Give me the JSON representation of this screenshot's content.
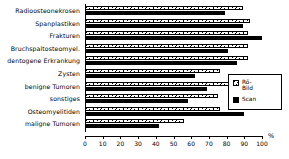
{
  "chart_data": {
    "type": "bar",
    "orientation": "horizontal",
    "title": "",
    "xlabel": "%",
    "ylabel": "",
    "xlim": [
      0,
      100
    ],
    "xticks": [
      0,
      10,
      20,
      30,
      40,
      50,
      60,
      70,
      80,
      90,
      100
    ],
    "grid": false,
    "legend_position": "right",
    "categories": [
      "Radioosteonekrosen",
      "Spanplastiken",
      "Frakturen",
      "Bruchspaltosteomyel.",
      "dentogene Erkrankung",
      "Zysten",
      "benigne Tumoren",
      "sonstiges",
      "Osteomyelitiden",
      "maligne Tumoren"
    ],
    "series": [
      {
        "name": "Rö-Bild",
        "pattern": "hatched",
        "color": "#ffffff",
        "values": [
          89,
          93,
          92,
          92,
          92,
          76,
          83,
          75,
          76,
          56
        ]
      },
      {
        "name": "Scan",
        "pattern": "solid",
        "color": "#000000",
        "values": [
          79,
          89,
          100,
          81,
          86,
          62,
          69,
          58,
          90,
          42
        ]
      }
    ]
  },
  "legend": {
    "items": [
      {
        "label": "Rö-\nBild",
        "swatch": "hatched-swatch"
      },
      {
        "label": "Scan",
        "swatch": "solid-black-swatch"
      }
    ]
  },
  "axis": {
    "unit_label": "%",
    "tick_labels": [
      "0",
      "10",
      "20",
      "30",
      "40",
      "50",
      "60",
      "70",
      "80",
      "90",
      "100"
    ]
  }
}
